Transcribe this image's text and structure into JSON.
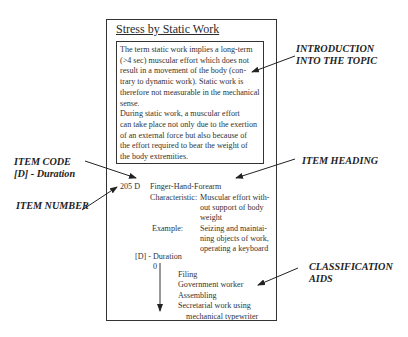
{
  "card": {
    "title": "Stress by Static Work",
    "intro_text": "The term static work implies a long-term\n(>4 sec) muscular effort which does not\nresult in a movement of the body (con-\ntrary to dynamic work). Static work is\ntherefore not measurable in the mechanical\nsense.\nDuring static work, a muscular effort\ncan take place not only due to the exertion\nof an external force but also because of\nthe effort required to bear the weight of\nthe body extremities.",
    "item": {
      "number_code": "205 D",
      "heading": "Finger-Hand-Forearm",
      "characteristic_label": "Characteristic:",
      "characteristic_text": "Muscular effort with-\nout support of body\nweight",
      "example_label": "Example:",
      "example_text": "Seizing and maintai-\nning objects of work,\noperating a keyboard"
    },
    "duration": {
      "label": "[D] - Duration",
      "scale_start": "0",
      "aids": "Filing\nGovernment worker\nAssembling\nSecretarial work using\n    mechanical typewriter"
    }
  },
  "annotations": {
    "introduction": "INTRODUCTION\nINTO THE TOPIC",
    "item_code": "ITEM CODE\n[D] - Duration",
    "item_number": "ITEM NUMBER",
    "item_heading": "ITEM HEADING",
    "classification_aids": "CLASSIFICATION\nAIDS"
  }
}
